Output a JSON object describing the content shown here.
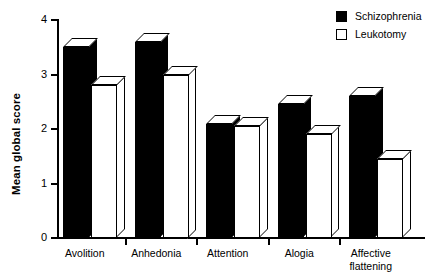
{
  "chart_data": {
    "type": "bar",
    "title": "",
    "xlabel": "",
    "ylabel": "Mean global score",
    "ylim": [
      0,
      4
    ],
    "yticks": [
      0,
      1,
      2,
      3,
      4
    ],
    "ytick_labels": [
      "0",
      "1",
      "2",
      "3",
      "4"
    ],
    "grid": false,
    "legend_position": "top-right",
    "style": "3d-bars",
    "categories": [
      "Avolition",
      "Anhedonia",
      "Attention",
      "Alogia",
      "Affective\nflattening"
    ],
    "series": [
      {
        "name": "Schizophrenia",
        "fill": "#000000",
        "values": [
          3.5,
          3.6,
          2.1,
          2.45,
          2.6
        ]
      },
      {
        "name": "Leukotomy",
        "fill": "#ffffff",
        "values": [
          2.8,
          3.0,
          2.05,
          1.9,
          1.45
        ]
      }
    ]
  },
  "legend": {
    "items": [
      {
        "label": "Schizophrenia",
        "swatch": "filled-square"
      },
      {
        "label": "Leukotomy",
        "swatch": "open-square"
      }
    ]
  },
  "axis": {
    "y_title": "Mean global score",
    "y_tick_labels": [
      "4",
      "3",
      "2",
      "1",
      "0"
    ]
  },
  "colors": {
    "axis": "#000000",
    "series_schizophrenia": "#000000",
    "series_leukotomy": "#ffffff",
    "background": "#ffffff"
  }
}
